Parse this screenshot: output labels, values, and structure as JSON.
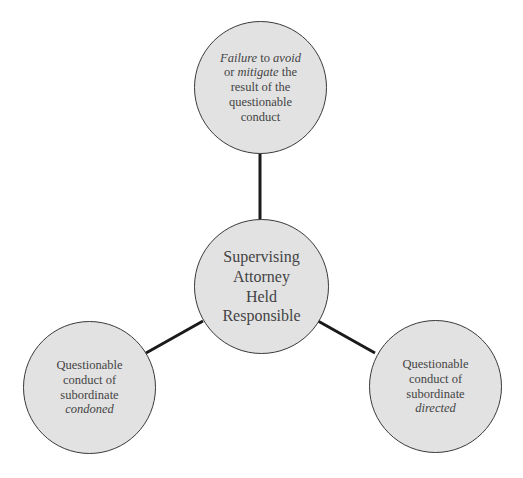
{
  "diagram": {
    "type": "hub-and-spoke",
    "colors": {
      "node_fill": "#e2e2e2",
      "node_border": "#3a3a3a",
      "connector": "#1a1a1a",
      "text": "#444444"
    },
    "center": {
      "lines": [
        "Supervising",
        "Attorney",
        "Held",
        "Responsible"
      ]
    },
    "nodes": [
      {
        "id": "top",
        "lines": [
          [
            {
              "text": "Failure",
              "italic": true
            },
            {
              "text": " to ",
              "italic": false
            },
            {
              "text": "avoid",
              "italic": true
            }
          ],
          [
            {
              "text": "or ",
              "italic": false
            },
            {
              "text": "mitigate",
              "italic": true
            },
            {
              "text": " the",
              "italic": false
            }
          ],
          [
            {
              "text": "result of the",
              "italic": false
            }
          ],
          [
            {
              "text": "questionable",
              "italic": false
            }
          ],
          [
            {
              "text": "conduct",
              "italic": false
            }
          ]
        ]
      },
      {
        "id": "bottom-left",
        "lines": [
          [
            {
              "text": "Questionable",
              "italic": false
            }
          ],
          [
            {
              "text": "conduct of",
              "italic": false
            }
          ],
          [
            {
              "text": "subordinate",
              "italic": false
            }
          ],
          [
            {
              "text": "condoned",
              "italic": true
            }
          ]
        ]
      },
      {
        "id": "bottom-right",
        "lines": [
          [
            {
              "text": "Questionable",
              "italic": false
            }
          ],
          [
            {
              "text": "conduct of",
              "italic": false
            }
          ],
          [
            {
              "text": "subordinate",
              "italic": false
            }
          ],
          [
            {
              "text": "directed",
              "italic": true
            }
          ]
        ]
      }
    ],
    "edges": [
      {
        "from": "center",
        "to": "top"
      },
      {
        "from": "center",
        "to": "bottom-left"
      },
      {
        "from": "center",
        "to": "bottom-right"
      }
    ]
  },
  "text": {
    "top_l1_a": "Failure",
    "top_l1_b": " to ",
    "top_l1_c": "avoid",
    "top_l2_a": "or ",
    "top_l2_b": "mitigate",
    "top_l2_c": " the",
    "top_l3": "result of the",
    "top_l4": "questionable",
    "top_l5": "conduct",
    "center_l1": "Supervising",
    "center_l2": "Attorney",
    "center_l3": "Held",
    "center_l4": "Responsible",
    "left_l1": "Questionable",
    "left_l2": "conduct of",
    "left_l3": "subordinate",
    "left_l4": "condoned",
    "right_l1": "Questionable",
    "right_l2": "conduct of",
    "right_l3": "subordinate",
    "right_l4": "directed"
  }
}
